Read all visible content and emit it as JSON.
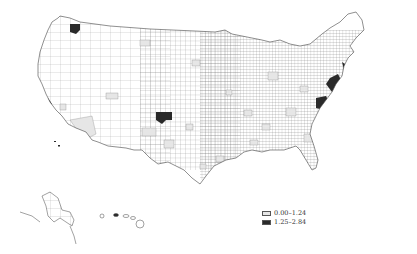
{
  "map": {
    "type": "choropleth",
    "region": "United States counties",
    "colors": {
      "background": "#ffffff",
      "border": "#444444",
      "low": "#e6e6e6",
      "high": "#2a2a2a",
      "base": "#ffffff"
    }
  },
  "legend": {
    "items": [
      {
        "label": "0.00–1.24",
        "color": "#e6e6e6"
      },
      {
        "label": "1.25–2.84",
        "color": "#2a2a2a"
      }
    ]
  },
  "highlighted_high_regions": [
    "Seattle area (WA)",
    "San Francisco Bay area (CA)",
    "Los Angeles area (CA)",
    "Denver area (CO)",
    "Boston area (MA)",
    "New York City area (NY/NJ)",
    "Washington DC area",
    "Honolulu (HI)"
  ]
}
